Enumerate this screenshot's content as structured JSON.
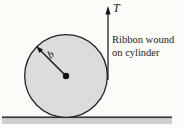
{
  "diagram": {
    "tension_label": "T",
    "radius_label": "b",
    "caption": {
      "line1": "Ribbon wound",
      "line2": "on cylinder"
    },
    "colors": {
      "background": "#fcfbf8",
      "cylinder_fill": "#dcdcdc",
      "cylinder_stroke": "#222222",
      "ground_band": "#cdcdcd",
      "ground_line": "#3a3a3a",
      "line": "#141414"
    }
  }
}
